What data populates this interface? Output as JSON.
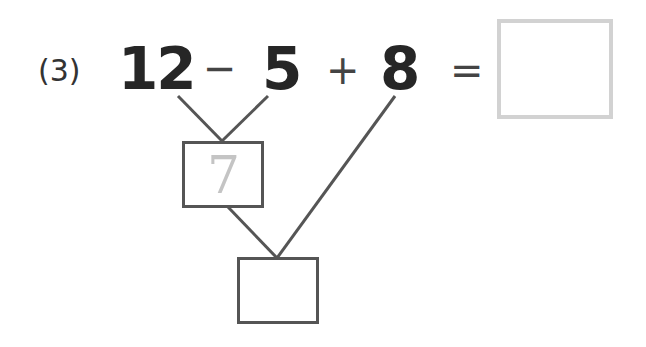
{
  "problem": {
    "label": "(3)",
    "operands": [
      "12",
      "5",
      "8"
    ],
    "operators": [
      "−",
      "+"
    ],
    "equals": "=",
    "answer": ""
  },
  "tree": {
    "intermediate_value": "7",
    "intermediate_hint_color": "#c4c4c4",
    "final_value": ""
  },
  "colors": {
    "text": "#262626",
    "lines": "#555555",
    "answer_box_border": "#d2d2d2"
  }
}
